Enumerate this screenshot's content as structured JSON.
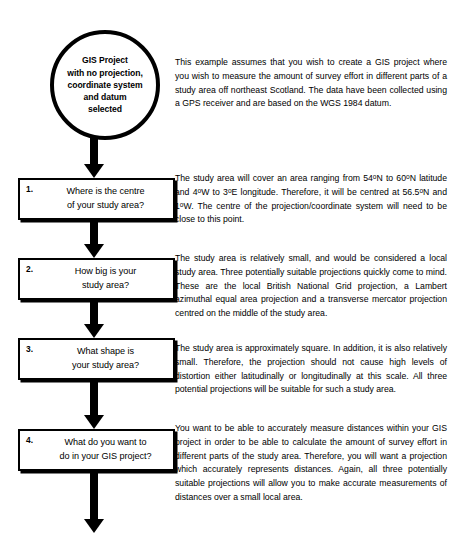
{
  "diagram": {
    "start_node": {
      "label": "GIS Project\nwith no projection,\ncoordinate system\nand datum\nselected",
      "shape": "circle"
    },
    "steps": [
      {
        "number": "1.",
        "question": "Where is the centre\nof your study area?"
      },
      {
        "number": "2.",
        "question": "How big is your\nstudy area?"
      },
      {
        "number": "3.",
        "question": "What shape is\nyour study area?"
      },
      {
        "number": "4.",
        "question": "What do you want to\ndo in your GIS project?"
      }
    ],
    "arrows": [
      "arrow-start-to-step1",
      "arrow-step1-to-step2",
      "arrow-step2-to-step3",
      "arrow-step3-to-step4",
      "arrow-step4-to-next"
    ]
  },
  "annotations": {
    "intro": "This example assumes that you wish to create a GIS project where you wish to measure the amount of survey effort in different parts of a study area off northeast Scotland. The data have been collected using a GPS receiver and are based on the WGS 1984 datum.",
    "step_1": "The study area will cover an area ranging from 54°N to 60°N latitude and 4°W to 3°E longitude. Therefore, it will be centred at 56.5°N and 1°W. The centre of the projection/coordinate system will need to be close to this point.",
    "step_2": "The study area is relatively small, and would be considered a local study area. Three potentially suitable projections quickly come to mind. These are the local British National Grid projection, a Lambert azimuthal equal area projection and a transverse mercator projection centred on the middle of the study area.",
    "step_3": "The study area is approximately square. In addition, it is also relatively small. Therefore, the projection should not cause high levels of distortion either latitudinally or longitudinally at this scale. All three potential projections will be suitable for such a study area.",
    "step_4": "You want to be able to accurately measure distances within your GIS project in order to be able to calculate the amount of survey effort in different parts of the study area. Therefore, you will want a projection which accurately represents distances. Again, all three potentially suitable projections will allow you to make accurate measurements of distances over a small local area."
  },
  "colors": {
    "stroke": "#000000",
    "background": "#ffffff",
    "text": "#000000"
  }
}
